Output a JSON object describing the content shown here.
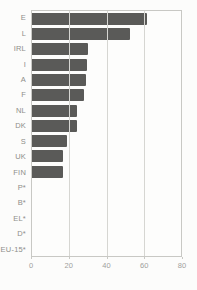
{
  "chart_data": {
    "type": "bar",
    "orientation": "horizontal",
    "title": "",
    "xlabel": "",
    "ylabel": "",
    "categories": [
      "E",
      "L",
      "IRL",
      "I",
      "A",
      "F",
      "NL",
      "DK",
      "S",
      "UK",
      "FIN",
      "P*",
      "B*",
      "EL*",
      "D*",
      "EU-15*"
    ],
    "values": [
      62,
      52.5,
      30.2,
      29.7,
      28.8,
      27.9,
      24.4,
      24,
      18.8,
      16.6,
      16.5,
      0,
      0,
      0,
      0,
      0
    ],
    "xlim": [
      0,
      80
    ],
    "x_ticks": [
      "0",
      "20",
      "40",
      "60",
      "80"
    ],
    "x_tick_values": [
      0,
      20,
      40,
      60,
      80
    ],
    "grid": true,
    "legend": false,
    "colors": {
      "bar": "#5a5a58",
      "grid": "#d6d6d2",
      "border": "#c8c8c4",
      "label": "#8e8e8a",
      "tick_label": "#a0a09c",
      "background": "#fcfcfb"
    }
  }
}
